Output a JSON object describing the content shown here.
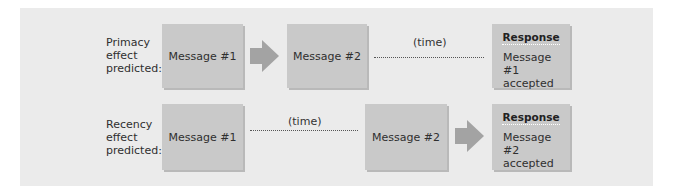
{
  "colors": {
    "panel": "#ebebeb",
    "box": "#c9c9c9",
    "arrow": "#a3a3a3"
  },
  "rows": [
    {
      "label_lines": [
        "Primacy",
        "effect",
        "predicted:"
      ],
      "message_1": "Message #1",
      "message_2": "Message #2",
      "time_label": "(time)",
      "response_title": "Response",
      "response_lines": [
        "Message #1",
        "accepted"
      ]
    },
    {
      "label_lines": [
        "Recency",
        "effect",
        "predicted:"
      ],
      "message_1": "Message #1",
      "message_2": "Message #2",
      "time_label": "(time)",
      "response_title": "Response",
      "response_lines": [
        "Message #2",
        "accepted"
      ]
    }
  ]
}
